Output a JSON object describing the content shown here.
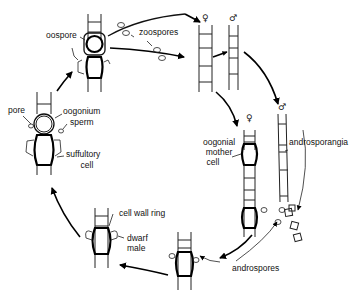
{
  "diagram": {
    "type": "life-cycle",
    "labels": {
      "oospore": "oospore",
      "zoospores": "zoospores",
      "pore": "pore",
      "oogonium": "oogonium",
      "sperm": "sperm",
      "suffultory_line1": "suffultory",
      "suffultory_line2": "cell",
      "oogonial_line1": "oogonial",
      "oogonial_line2": "mother",
      "oogonial_line3": "cell",
      "androsporangia": "androsporangia",
      "cell_wall_ring": "cell wall ring",
      "dwarf_line1": "dwarf",
      "dwarf_line2": "male",
      "androspores": "androspores"
    },
    "symbols": {
      "female_top": "♀",
      "male_top": "♂",
      "female_mid": "♀",
      "male_mid": "♂"
    },
    "stages": [
      "oospore",
      "zoospores",
      "female filament",
      "male filament",
      "oogonial mother cell",
      "androsporangia",
      "androspores",
      "androspore attached",
      "dwarf male",
      "oogonium fertilization"
    ],
    "colors": {
      "ink": "#111111",
      "background": "#ffffff"
    }
  }
}
